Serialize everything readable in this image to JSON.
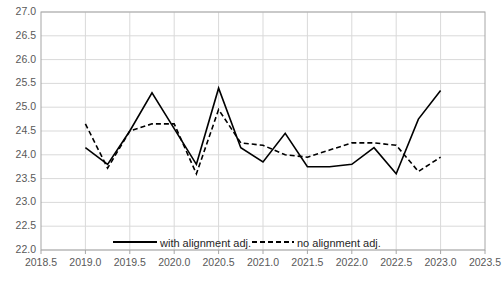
{
  "chart_data": {
    "type": "line",
    "title": "",
    "xlabel": "",
    "ylabel": "",
    "xlim": [
      2018.5,
      2023.5
    ],
    "ylim": [
      22.0,
      27.0
    ],
    "grid": true,
    "legend_position": "bottom-inside",
    "xticks": [
      "2018.5",
      "2019.0",
      "2019.5",
      "2020.0",
      "2020.5",
      "2021.0",
      "2021.5",
      "2022.0",
      "2022.5",
      "2023.0",
      "2023.5"
    ],
    "yticks": [
      "22.0",
      "22.5",
      "23.0",
      "23.5",
      "24.0",
      "24.5",
      "25.0",
      "25.5",
      "26.0",
      "26.5",
      "27.0"
    ],
    "series": [
      {
        "name": "with alignment adj.",
        "style": "solid",
        "color": "#000000",
        "x": [
          2019.0,
          2019.25,
          2019.5,
          2019.75,
          2020.0,
          2020.25,
          2020.5,
          2020.75,
          2021.0,
          2021.25,
          2021.5,
          2021.75,
          2022.0,
          2022.25,
          2022.5,
          2022.75,
          2023.0
        ],
        "y": [
          24.15,
          23.8,
          24.5,
          25.3,
          24.55,
          23.8,
          25.4,
          24.15,
          23.85,
          24.45,
          23.75,
          23.75,
          23.8,
          24.15,
          23.6,
          24.75,
          25.35
        ]
      },
      {
        "name": "no alignment adj.",
        "style": "dashed",
        "color": "#000000",
        "x": [
          2019.0,
          2019.25,
          2019.5,
          2019.75,
          2020.0,
          2020.25,
          2020.5,
          2020.75,
          2021.0,
          2021.25,
          2021.5,
          2021.75,
          2022.0,
          2022.25,
          2022.5,
          2022.75,
          2023.0
        ],
        "y": [
          24.65,
          23.72,
          24.5,
          24.65,
          24.65,
          23.6,
          24.95,
          24.25,
          24.2,
          24.0,
          23.95,
          24.1,
          24.25,
          24.25,
          24.2,
          23.65,
          23.95
        ]
      }
    ]
  },
  "legend": {
    "items": [
      {
        "label": "with alignment adj."
      },
      {
        "label": "no alignment adj."
      }
    ]
  }
}
